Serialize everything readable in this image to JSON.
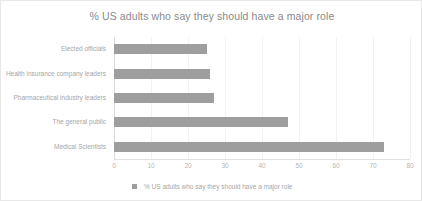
{
  "chart_data": {
    "type": "bar",
    "orientation": "horizontal",
    "title": "% US adults who say they should have a major role",
    "xlabel": "",
    "ylabel": "",
    "categories": [
      "Elected officials",
      "Health insurance company leaders",
      "Pharmaceutical industry leaders",
      "The general public",
      "Medical Scientists"
    ],
    "values": [
      25,
      26,
      27,
      47,
      73
    ],
    "series": [
      {
        "name": "% US adults who say they should have a major role",
        "values": [
          25,
          26,
          27,
          47,
          73
        ]
      }
    ],
    "xlim": [
      0,
      80
    ],
    "xticks": [
      0,
      10,
      20,
      30,
      40,
      50,
      60,
      70,
      80
    ],
    "xtick_labels": [
      "0",
      "10",
      "20",
      "30",
      "40",
      "50",
      "60",
      "70",
      "80"
    ],
    "grid": true,
    "legend": {
      "position": "bottom",
      "entries": [
        "% US adults who say they should have a major role"
      ]
    },
    "colors": {
      "bar": "#9e9e9e",
      "title_text": "#8a8a8a",
      "label_text": "#a6a6a6",
      "tick_text": "#b5b5b5",
      "gridline": "#f2f2f2",
      "axis": "#d9d9d9",
      "background": "#ffffff",
      "border": "#e8e8e8"
    }
  }
}
